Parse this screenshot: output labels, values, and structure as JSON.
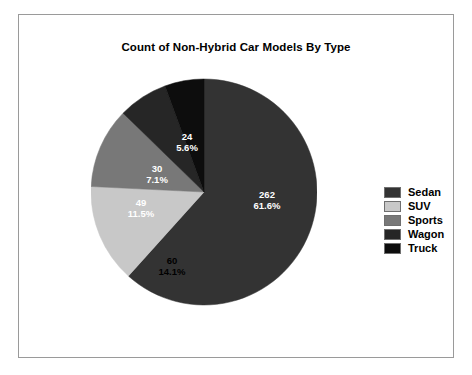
{
  "chart": {
    "title": "Count of Non-Hybrid Car Models By Type",
    "background": "#ffffff",
    "frame_color": "#9a9a9a"
  },
  "chart_data": {
    "type": "pie",
    "title": "Count of Non-Hybrid Car Models By Type",
    "xlabel": "",
    "ylabel": "",
    "total": 425,
    "start_angle_deg": 0,
    "direction": "clockwise",
    "legend_position": "right",
    "grid": false,
    "categories": [
      "Sedan",
      "SUV",
      "Sports",
      "Wagon",
      "Truck"
    ],
    "values": [
      262,
      60,
      49,
      30,
      24
    ],
    "percents": [
      "61.6%",
      "14.1%",
      "11.5%",
      "7.1%",
      "5.6%"
    ],
    "percent_values": [
      61.6,
      14.1,
      11.5,
      7.1,
      5.6
    ],
    "colors": [
      "#333333",
      "#c8c8c8",
      "#787878",
      "#262626",
      "#0d0d0d"
    ],
    "slices": [
      {
        "name": "Sedan",
        "value": "262",
        "percent": "61.6%",
        "color": "#333333",
        "label_color": "#ffffff",
        "label_x": 176,
        "label_y": 112
      },
      {
        "name": "SUV",
        "value": "60",
        "percent": "14.1%",
        "color": "#c8c8c8",
        "label_color": "#000000",
        "label_x": 81,
        "label_y": 178
      },
      {
        "name": "Sports",
        "value": "49",
        "percent": "11.5%",
        "color": "#787878",
        "label_color": "#ffffff",
        "label_x": 50,
        "label_y": 120
      },
      {
        "name": "Wagon",
        "value": "30",
        "percent": "7.1%",
        "color": "#262626",
        "label_color": "#ffffff",
        "label_x": 66,
        "label_y": 86
      },
      {
        "name": "Truck",
        "value": "24",
        "percent": "5.6%",
        "color": "#0d0d0d",
        "label_color": "#ffffff",
        "label_x": 96,
        "label_y": 54
      }
    ]
  },
  "legend": {
    "items": [
      {
        "label": "Sedan",
        "color": "#333333"
      },
      {
        "label": "SUV",
        "color": "#c8c8c8"
      },
      {
        "label": "Sports",
        "color": "#787878"
      },
      {
        "label": "Wagon",
        "color": "#262626"
      },
      {
        "label": "Truck",
        "color": "#0d0d0d"
      }
    ]
  }
}
